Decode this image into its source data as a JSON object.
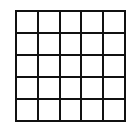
{
  "grid": {
    "rows": 5,
    "cols": 5,
    "line_color": "#111111",
    "fill_color": "#ffffff",
    "cells": [
      [
        "",
        "",
        "",
        "",
        ""
      ],
      [
        "",
        "",
        "",
        "",
        ""
      ],
      [
        "",
        "",
        "",
        "",
        ""
      ],
      [
        "",
        "",
        "",
        "",
        ""
      ],
      [
        "",
        "",
        "",
        "",
        ""
      ]
    ]
  }
}
